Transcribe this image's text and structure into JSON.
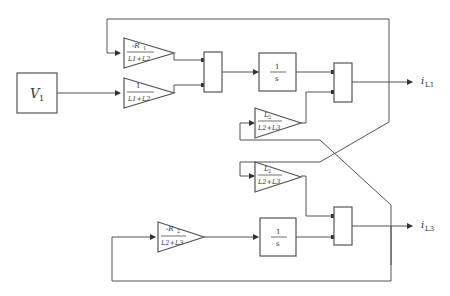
{
  "diagram": {
    "type": "block-diagram",
    "source_block": {
      "label": "V",
      "subscript": "1"
    },
    "gains": [
      {
        "id": "gain-top-1",
        "numerator": "-R",
        "numerator_sub": "1",
        "denominator": "L1+L2"
      },
      {
        "id": "gain-top-2",
        "numerator": "1",
        "numerator_sub": "",
        "denominator": "L1+L2"
      },
      {
        "id": "gain-mid-1",
        "numerator": "L",
        "numerator_sub": "2",
        "denominator": "L2+L3"
      },
      {
        "id": "gain-mid-2",
        "numerator": "L",
        "numerator_sub": "2",
        "denominator": "L2+L3"
      },
      {
        "id": "gain-bottom",
        "numerator": "-R",
        "numerator_sub": "2",
        "denominator": "L2+L3"
      }
    ],
    "integrators": [
      {
        "id": "integrator-top",
        "numerator": "1",
        "denominator": "s"
      },
      {
        "id": "integrator-bottom",
        "numerator": "1",
        "denominator": "s"
      }
    ],
    "sums": [
      "sum-top-left",
      "sum-top-right",
      "sum-bottom-right"
    ],
    "outputs": [
      {
        "label": "i",
        "subscript": "L1"
      },
      {
        "label": "i",
        "subscript": "L3"
      }
    ]
  }
}
